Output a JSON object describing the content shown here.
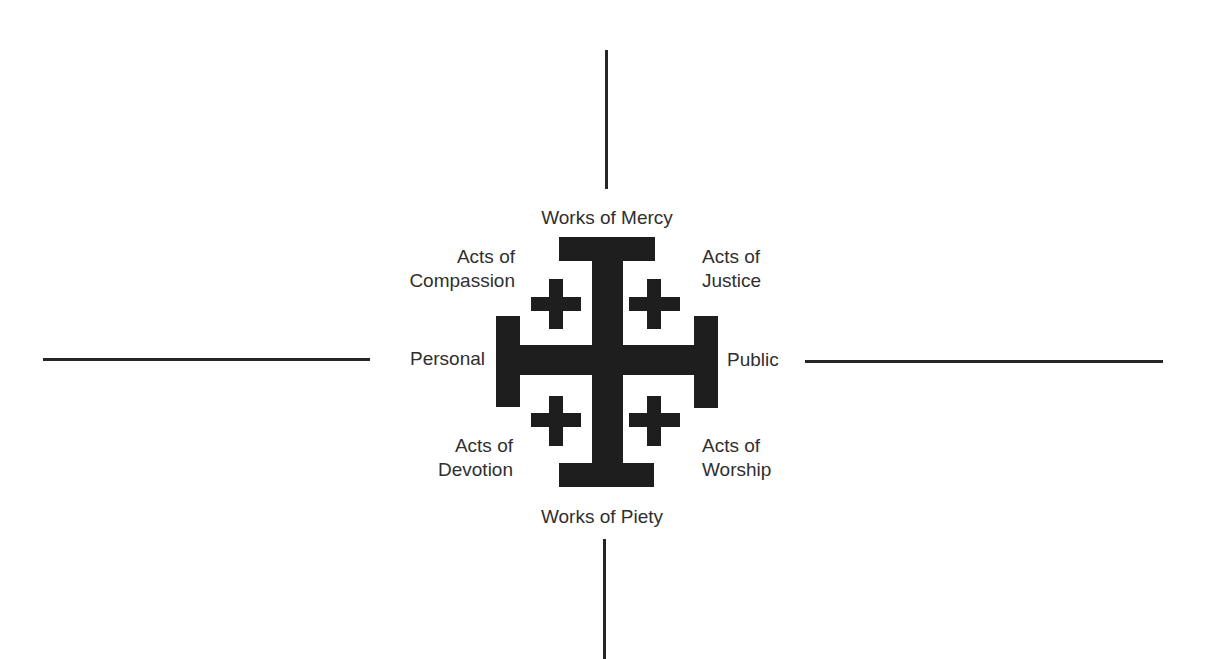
{
  "diagram": {
    "type": "quadrant-cross-diagram",
    "center_symbol": "jerusalem-cross",
    "colors": {
      "background": "#ffffff",
      "cross_fill": "#1e1e1e",
      "line": "#262626",
      "text": "#2f2f2f"
    },
    "axes": {
      "top": {
        "label": "Works of Mercy"
      },
      "bottom": {
        "label": "Works of Piety"
      },
      "left": {
        "label": "Personal"
      },
      "right": {
        "label": "Public"
      }
    },
    "quadrants": {
      "top_left": {
        "line1": "Acts of",
        "line2": "Compassion"
      },
      "top_right": {
        "line1": "Acts of",
        "line2": "Justice"
      },
      "bottom_left": {
        "line1": "Acts of",
        "line2": "Devotion"
      },
      "bottom_right": {
        "line1": "Acts of",
        "line2": "Worship"
      }
    }
  }
}
